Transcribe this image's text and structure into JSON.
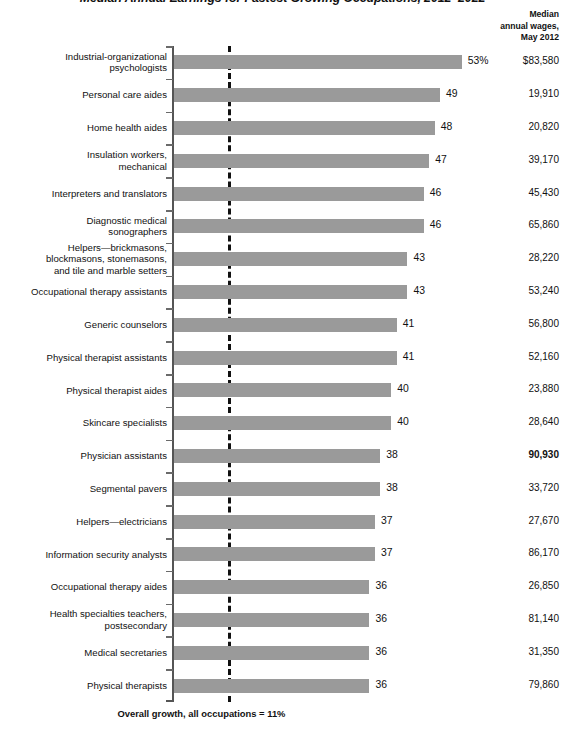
{
  "title": "Median Annual Earnings for Fastest Growing Occupations, 2012–2022",
  "column_header": {
    "line1": "Median",
    "line2": "annual wages,",
    "line3": "May 2012"
  },
  "footnote": "Overall growth, all occupations = 11%",
  "colors": {
    "bar": "#9a9a9a",
    "axis": "#555555",
    "reference_line": "#111111",
    "text": "#111111"
  },
  "chart_data": {
    "type": "bar",
    "orientation": "horizontal",
    "title": "Median Annual Earnings for Fastest Growing Occupations, 2012–2022",
    "xlabel": "",
    "ylabel": "",
    "xlim": [
      0,
      55
    ],
    "grid": false,
    "legend": "none",
    "value_unit": "percent projected growth",
    "reference_line": {
      "value": 11,
      "label": "Overall growth, all occupations = 11%",
      "style": "dashed"
    },
    "secondary_column": {
      "header": "Median annual wages, May 2012",
      "unit": "USD"
    },
    "categories": [
      "Industrial-organizational psychologists",
      "Personal care aides",
      "Home health aides",
      "Insulation workers, mechanical",
      "Interpreters and translators",
      "Diagnostic medical sonographers",
      "Helpers—brickmasons, blockmasons, stonemasons, and tile and marble setters",
      "Occupational therapy assistants",
      "Generic counselors",
      "Physical therapist assistants",
      "Physical therapist aides",
      "Skincare specialists",
      "Physician assistants",
      "Segmental pavers",
      "Helpers—electricians",
      "Information security analysts",
      "Occupational therapy aides",
      "Health specialties teachers, postsecondary",
      "Medical secretaries",
      "Physical therapists"
    ],
    "values": [
      53,
      49,
      48,
      47,
      46,
      46,
      43,
      43,
      41,
      41,
      40,
      40,
      38,
      38,
      37,
      37,
      36,
      36,
      36,
      36
    ],
    "wages": [
      83580,
      19910,
      20820,
      39170,
      45430,
      65860,
      28220,
      53240,
      56800,
      52160,
      23880,
      28640,
      90930,
      33720,
      27670,
      86170,
      26850,
      81140,
      31350,
      79860
    ]
  },
  "rows": [
    {
      "label_lines": [
        "Industrial-organizational",
        "psychologists"
      ],
      "value": 53,
      "value_label": "53%",
      "wage": "$83,580",
      "wage_bold": false
    },
    {
      "label_lines": [
        "Personal care aides"
      ],
      "value": 49,
      "value_label": "49",
      "wage": "19,910",
      "wage_bold": false
    },
    {
      "label_lines": [
        "Home health aides"
      ],
      "value": 48,
      "value_label": "48",
      "wage": "20,820",
      "wage_bold": false
    },
    {
      "label_lines": [
        "Insulation workers,",
        "mechanical"
      ],
      "value": 47,
      "value_label": "47",
      "wage": "39,170",
      "wage_bold": false
    },
    {
      "label_lines": [
        "Interpreters and translators"
      ],
      "value": 46,
      "value_label": "46",
      "wage": "45,430",
      "wage_bold": false
    },
    {
      "label_lines": [
        "Diagnostic medical",
        "sonographers"
      ],
      "value": 46,
      "value_label": "46",
      "wage": "65,860",
      "wage_bold": false
    },
    {
      "label_lines": [
        "Helpers—brickmasons,",
        "blockmasons, stonemasons,",
        "and tile and marble setters"
      ],
      "value": 43,
      "value_label": "43",
      "wage": "28,220",
      "wage_bold": false
    },
    {
      "label_lines": [
        "Occupational therapy assistants"
      ],
      "value": 43,
      "value_label": "43",
      "wage": "53,240",
      "wage_bold": false
    },
    {
      "label_lines": [
        "Generic counselors"
      ],
      "value": 41,
      "value_label": "41",
      "wage": "56,800",
      "wage_bold": false
    },
    {
      "label_lines": [
        "Physical therapist assistants"
      ],
      "value": 41,
      "value_label": "41",
      "wage": "52,160",
      "wage_bold": false
    },
    {
      "label_lines": [
        "Physical therapist aides"
      ],
      "value": 40,
      "value_label": "40",
      "wage": "23,880",
      "wage_bold": false
    },
    {
      "label_lines": [
        "Skincare specialists"
      ],
      "value": 40,
      "value_label": "40",
      "wage": "28,640",
      "wage_bold": false
    },
    {
      "label_lines": [
        "Physician assistants"
      ],
      "value": 38,
      "value_label": "38",
      "wage": "90,930",
      "wage_bold": true
    },
    {
      "label_lines": [
        "Segmental pavers"
      ],
      "value": 38,
      "value_label": "38",
      "wage": "33,720",
      "wage_bold": false
    },
    {
      "label_lines": [
        "Helpers—electricians"
      ],
      "value": 37,
      "value_label": "37",
      "wage": "27,670",
      "wage_bold": false
    },
    {
      "label_lines": [
        "Information security analysts"
      ],
      "value": 37,
      "value_label": "37",
      "wage": "86,170",
      "wage_bold": false
    },
    {
      "label_lines": [
        "Occupational therapy aides"
      ],
      "value": 36,
      "value_label": "36",
      "wage": "26,850",
      "wage_bold": false
    },
    {
      "label_lines": [
        "Health specialties teachers,",
        "postsecondary"
      ],
      "value": 36,
      "value_label": "36",
      "wage": "81,140",
      "wage_bold": false
    },
    {
      "label_lines": [
        "Medical secretaries"
      ],
      "value": 36,
      "value_label": "36",
      "wage": "31,350",
      "wage_bold": false
    },
    {
      "label_lines": [
        "Physical therapists"
      ],
      "value": 36,
      "value_label": "36",
      "wage": "79,860",
      "wage_bold": false
    }
  ]
}
